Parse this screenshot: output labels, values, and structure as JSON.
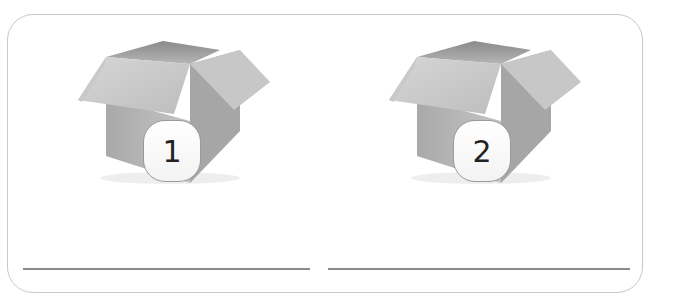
{
  "worksheet": {
    "items": [
      {
        "label": "1",
        "icon": "open-cardboard-box-icon"
      },
      {
        "label": "2",
        "icon": "open-cardboard-box-icon"
      }
    ],
    "answer_lines": 2
  }
}
